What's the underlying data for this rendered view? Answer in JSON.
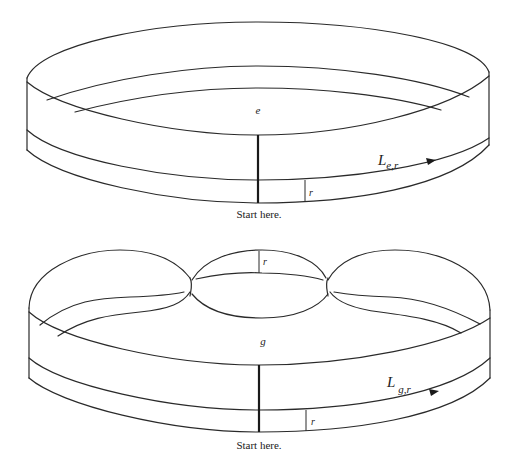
{
  "figures": [
    {
      "id": "e",
      "center_label": "e",
      "path_label_main": "L",
      "path_label_sub": "e,r",
      "radius_label": "r",
      "start_label": "Start here."
    },
    {
      "id": "g",
      "center_label": "g",
      "path_label_main": "L",
      "path_label_sub": "g,r",
      "radius_label": "r",
      "lobe_radius_label": "r",
      "start_label": "Start here."
    }
  ],
  "colors": {
    "line": "#2a2a2a",
    "background": "#ffffff"
  }
}
